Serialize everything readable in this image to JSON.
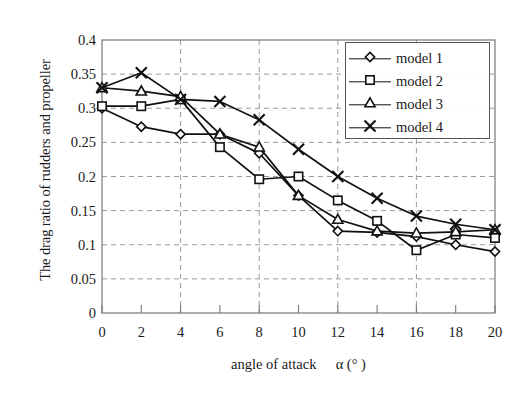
{
  "chart_data": {
    "type": "line",
    "title": "",
    "xlabel": "angle of attack α (° )",
    "ylabel": "The drag ratio of rudders and propeller",
    "x": [
      0,
      2,
      4,
      6,
      8,
      10,
      12,
      14,
      16,
      18,
      20
    ],
    "xlim": [
      0,
      20
    ],
    "ylim": [
      0,
      0.4
    ],
    "xticks": [
      "0",
      "2",
      "4",
      "6",
      "8",
      "10",
      "12",
      "14",
      "16",
      "18",
      "20"
    ],
    "yticks": [
      "0",
      "0.05",
      "0.1",
      "0.15",
      "0.2",
      "0.25",
      "0.3",
      "0.35",
      "0.4"
    ],
    "ytick_values": [
      0,
      0.05,
      0.1,
      0.15,
      0.2,
      0.25,
      0.3,
      0.35,
      0.4
    ],
    "grid": true,
    "grid_style": "dashed",
    "legend_position": "upper right",
    "series": [
      {
        "name": "model 1",
        "marker": "diamond",
        "color": "#111111",
        "values": [
          0.3,
          0.273,
          0.262,
          0.262,
          0.234,
          0.172,
          0.12,
          0.118,
          0.112,
          0.1,
          0.09
        ]
      },
      {
        "name": "model 2",
        "marker": "square",
        "color": "#111111",
        "values": [
          0.303,
          0.303,
          0.313,
          0.243,
          0.196,
          0.2,
          0.165,
          0.135,
          0.092,
          0.115,
          0.11
        ]
      },
      {
        "name": "model 3",
        "marker": "triangle",
        "color": "#111111",
        "values": [
          0.33,
          0.325,
          0.317,
          0.262,
          0.243,
          0.172,
          0.137,
          0.12,
          0.117,
          0.119,
          0.122
        ]
      },
      {
        "name": "model 4",
        "marker": "cross",
        "color": "#111111",
        "values": [
          0.33,
          0.352,
          0.313,
          0.31,
          0.283,
          0.24,
          0.2,
          0.168,
          0.142,
          0.13,
          0.122
        ]
      }
    ]
  },
  "axis": {
    "y_title": "The drag ratio of rudders and propeller",
    "x_title_main": "angle of attack",
    "x_title_sym": "α (° )"
  },
  "legend": {
    "entries": [
      {
        "label": "model 1"
      },
      {
        "label": "model 2"
      },
      {
        "label": "model 3"
      },
      {
        "label": "model 4"
      }
    ]
  }
}
